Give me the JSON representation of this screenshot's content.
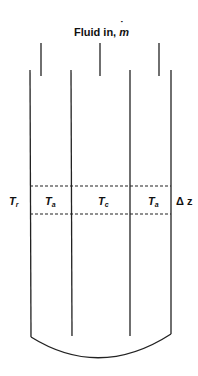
{
  "diagram": {
    "title": "Fluid in, ",
    "title_symbol": "m",
    "title_symbol_accent": "˙",
    "labels": {
      "outer_left": "T",
      "outer_left_sub": "r",
      "annulus_left": "T",
      "annulus_left_sub": "a",
      "core": "T",
      "core_sub": "c",
      "annulus_right": "T",
      "annulus_right_sub": "a",
      "slice": "Δ z"
    },
    "colors": {
      "line": "#222222",
      "background": "#ffffff"
    }
  }
}
